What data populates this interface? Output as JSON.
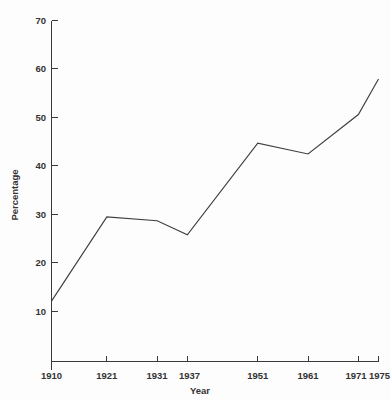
{
  "chart_data": {
    "type": "line",
    "title": "",
    "subtitle": "",
    "xlabel": "Year",
    "ylabel": "Percentage",
    "grid": false,
    "legend": false,
    "legend_position": "none",
    "x": [
      1910,
      1921,
      1931,
      1937,
      1951,
      1961,
      1971,
      1975
    ],
    "categories": [
      "1910",
      "1921",
      "1931",
      "1937",
      "1951",
      "1961",
      "1971",
      "1975"
    ],
    "values": [
      12.4,
      29.7,
      28.9,
      26.0,
      44.8,
      42.6,
      50.7,
      58.0
    ],
    "series": [
      {
        "name": "Percentage",
        "values": [
          12.4,
          29.7,
          28.9,
          26.0,
          44.8,
          42.6,
          50.7,
          58.0
        ]
      }
    ],
    "xlim": [
      1910,
      1975
    ],
    "ylim": [
      0,
      70
    ],
    "x_tick_labels": [
      "1910",
      "1921",
      "1931",
      "1937",
      "1951",
      "1961",
      "1971",
      "1975"
    ],
    "y_tick_labels": [
      "10",
      "20",
      "30",
      "40",
      "50",
      "60",
      "70"
    ],
    "y_ticks": [
      10,
      20,
      30,
      40,
      50,
      60,
      70
    ],
    "line_color": "#3f3f3f",
    "axis_color": "#3a3a3a",
    "background_color": "#fdfdfd",
    "markers": false,
    "annotations": []
  },
  "axes": {
    "y_title": "Percentage",
    "x_title": "Year"
  }
}
